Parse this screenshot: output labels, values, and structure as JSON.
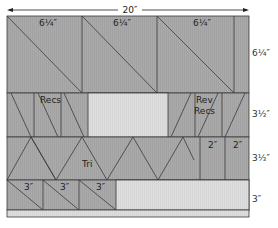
{
  "diagram": {
    "total_width_label": "20″",
    "colors": {
      "dark_fabric": "#a9a9a9",
      "light_fabric": "#dcdcdc",
      "line": "#3a3a3a",
      "background": "#ffffff"
    },
    "rows": [
      {
        "name": "row-1",
        "height_label": "6¼″",
        "pieces": [
          {
            "type": "half-square-triangle",
            "label": "6¼″"
          },
          {
            "type": "half-square-triangle",
            "label": "6¼″"
          },
          {
            "type": "half-square-triangle",
            "label": "6¼″"
          },
          {
            "type": "filler",
            "label": ""
          }
        ]
      },
      {
        "name": "row-2",
        "height_label": "3½″",
        "pieces": [
          {
            "type": "rectangles",
            "label": "Recs"
          },
          {
            "type": "light-filler",
            "label": ""
          },
          {
            "type": "reverse-rectangles",
            "label_line1": "Rev",
            "label_line2": "Recs"
          }
        ]
      },
      {
        "name": "row-3",
        "height_label": "3½″",
        "pieces": [
          {
            "type": "triangles",
            "label": "Tri"
          },
          {
            "type": "square",
            "label": "2″"
          },
          {
            "type": "square",
            "label": "2″"
          }
        ]
      },
      {
        "name": "row-4",
        "height_label": "3″",
        "pieces": [
          {
            "type": "half-square-triangle",
            "label": "3″"
          },
          {
            "type": "half-square-triangle",
            "label": "3″"
          },
          {
            "type": "half-square-triangle",
            "label": "3″"
          },
          {
            "type": "light-filler",
            "label": ""
          }
        ]
      }
    ]
  }
}
